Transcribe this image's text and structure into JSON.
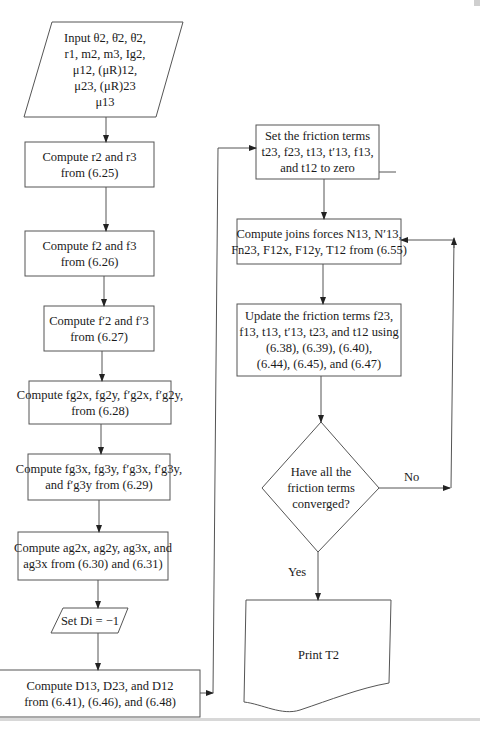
{
  "flowchart": {
    "left_column": {
      "input": {
        "shape": "parallelogram",
        "lines": [
          "Input θ2, θ̇2, θ̈2,",
          "r1, m2, m3, Ig2,",
          "μ12, (μR)12,",
          "μ23, (μR)23",
          "μ13"
        ]
      },
      "step1": {
        "shape": "rectangle",
        "lines": [
          "Compute r2 and r3",
          "from (6.25)"
        ]
      },
      "step2": {
        "shape": "rectangle",
        "lines": [
          "Compute f2 and f3",
          "from (6.26)"
        ]
      },
      "step3": {
        "shape": "rectangle",
        "lines": [
          "Compute f′2 and f′3",
          "from (6.27)"
        ]
      },
      "step4": {
        "shape": "rectangle",
        "lines": [
          "Compute fg2x, fg2y, f′g2x, f′g2y,",
          "from (6.28)"
        ]
      },
      "step5": {
        "shape": "rectangle",
        "lines": [
          "Compute fg3x, fg3y, f′g3x, f′g3y,",
          "and f′g3y from (6.29)"
        ]
      },
      "step6": {
        "shape": "rectangle",
        "lines": [
          "Compute ag2x, ag2y, ag3x, and",
          "ag3x from (6.30) and (6.31)"
        ]
      },
      "set_d": {
        "shape": "parallelogram",
        "lines": [
          "Set Di = −1"
        ]
      },
      "step7": {
        "shape": "rectangle",
        "lines": [
          "Compute D13, D23, and D12",
          "from (6.41), (6.46), and (6.48)"
        ]
      }
    },
    "right_column": {
      "init_friction": {
        "shape": "rectangle",
        "lines": [
          "Set the friction terms",
          "t23, f23, t13, t′13, f13,",
          "and t12 to zero"
        ]
      },
      "joint_forces": {
        "shape": "rectangle",
        "lines": [
          "Compute joins  forces N13, N′13,",
          "Fn23, F12x, F12y, T12 from (6.55)"
        ]
      },
      "update_friction": {
        "shape": "rectangle",
        "lines": [
          "Update the friction terms f23,",
          "f13, t13, t′13, t23, and t12 using",
          "(6.38), (6.39), (6.40),",
          "(6.44), (6.45), and (6.47)"
        ]
      },
      "decision": {
        "shape": "diamond",
        "lines": [
          "Have all the",
          "friction terms",
          "converged?"
        ]
      },
      "output": {
        "shape": "document",
        "lines": [
          "Print T2"
        ]
      }
    },
    "edge_labels": {
      "no": "No",
      "yes": "Yes"
    },
    "colors": {
      "stroke": "#555555",
      "text": "#1a1a1a",
      "background": "#ffffff"
    }
  }
}
